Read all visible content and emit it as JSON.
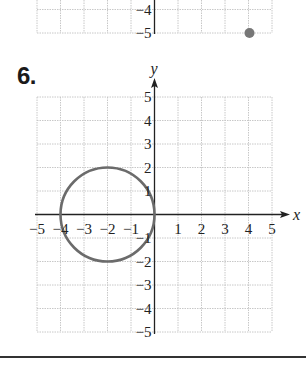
{
  "previous_graph": {
    "y_tick_labels": [
      "−4",
      "−5"
    ],
    "point": {
      "x": 4,
      "y": -5,
      "color": "#777777"
    }
  },
  "problem": {
    "number": "6.",
    "axis_labels": {
      "x": "x",
      "y": "y"
    },
    "x_tick_labels": [
      "−5",
      "−4",
      "−3",
      "−2",
      "−1",
      "1",
      "2",
      "3",
      "4",
      "5"
    ],
    "y_tick_labels": [
      "5",
      "4",
      "3",
      "2",
      "1",
      "−1",
      "−2",
      "−3",
      "−4",
      "−5"
    ]
  },
  "chart_data": {
    "type": "scatter",
    "title": "6.",
    "xlabel": "x",
    "ylabel": "y",
    "xlim": [
      -5,
      5
    ],
    "ylim": [
      -5,
      5
    ],
    "grid": true,
    "x_ticks": [
      -5,
      -4,
      -3,
      -2,
      -1,
      1,
      2,
      3,
      4,
      5
    ],
    "y_ticks": [
      -5,
      -4,
      -3,
      -2,
      -1,
      1,
      2,
      3,
      4,
      5
    ],
    "series": [
      {
        "name": "circle",
        "shape": "circle",
        "center": [
          -2,
          0
        ],
        "radius": 2,
        "equation": "(x+2)^2 + y^2 = 4",
        "color": "#6b6b6b"
      }
    ],
    "colors": {
      "curve": "#6b6b6b",
      "grid": "#c8c8c8",
      "axis": "#222222"
    }
  }
}
